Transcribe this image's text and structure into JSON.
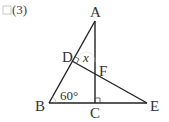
{
  "problem": {
    "checkbox": "",
    "number": "(3)"
  },
  "diagram": {
    "points": {
      "A": {
        "label": "A",
        "x": 95,
        "y": 21
      },
      "B": {
        "label": "B",
        "x": 49,
        "y": 103
      },
      "C": {
        "label": "C",
        "x": 95,
        "y": 103
      },
      "D": {
        "label": "D",
        "x": 72,
        "y": 61
      },
      "E": {
        "label": "E",
        "x": 147,
        "y": 103
      },
      "F": {
        "label": "F",
        "x": 95,
        "y": 74
      }
    },
    "angle_label": "60°",
    "unknown_label": "x",
    "line_color": "#222222"
  }
}
